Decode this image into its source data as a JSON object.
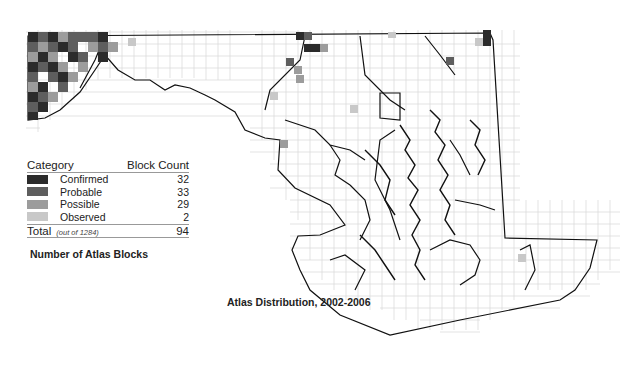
{
  "map": {
    "title": "Atlas Distribution, 2002-2006",
    "region": "Maryland",
    "grid_color": "#d8d8d8",
    "outline_color": "#111111"
  },
  "legend": {
    "header_category": "Category",
    "header_count": "Block Count",
    "items": [
      {
        "label": "Confirmed",
        "count": "32",
        "color": "#2b2b2b"
      },
      {
        "label": "Probable",
        "count": "33",
        "color": "#5e5e5e"
      },
      {
        "label": "Possible",
        "count": "29",
        "color": "#9c9c9c"
      },
      {
        "label": "Observed",
        "count": "2",
        "color": "#c8c8c8"
      }
    ],
    "total_label": "Total",
    "total_note": "(out of 1284)",
    "total_count": "94",
    "subtitle": "Number of Atlas Blocks"
  }
}
